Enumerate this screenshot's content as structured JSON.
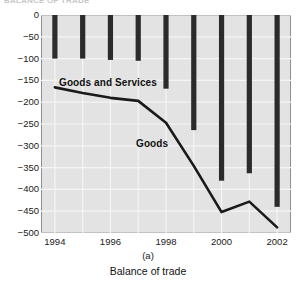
{
  "figure": {
    "clipped_heading": "BALANCE OF TRADE",
    "panel_letter": "(a)",
    "caption": "Balance of trade"
  },
  "colors": {
    "plot_background": "#e3e3e3",
    "gridline": "#f5f5f5",
    "bar": "#2b2b2b",
    "line": "#1a1a1a",
    "axis_border": "#8e8e8e",
    "text": "#111111"
  },
  "chart_data": {
    "type": "bar",
    "title": "Balance of trade",
    "xlabel": "",
    "ylabel": "",
    "xlim": [
      1993.5,
      2002.5
    ],
    "ylim": [
      -500,
      0
    ],
    "yticks": [
      0,
      -50,
      -100,
      -150,
      -200,
      -250,
      -300,
      -350,
      -400,
      -450,
      -500
    ],
    "ytick_labels": [
      "0",
      "-50",
      "-100",
      "-150",
      "-200",
      "-250",
      "-300",
      "-350",
      "-400",
      "-450",
      "-500"
    ],
    "xticks": [
      1994,
      1995,
      1996,
      1997,
      1998,
      1999,
      2000,
      2001,
      2002
    ],
    "xtick_labels": [
      "1994",
      "",
      "1996",
      "",
      "1998",
      "",
      "2000",
      "",
      "2002"
    ],
    "xtick_labels_shown": [
      "1994",
      "1996",
      "1998",
      "2000",
      "2002"
    ],
    "grid": true,
    "legend": "in-plot annotations",
    "categories": [
      1994,
      1995,
      1996,
      1997,
      1998,
      1999,
      2000,
      2001,
      2002
    ],
    "values": [
      -100,
      -100,
      -103,
      -105,
      -169,
      -264,
      -380,
      -363,
      -440
    ],
    "series": [
      {
        "name": "Goods and Services",
        "type": "bar",
        "x": [
          1994,
          1995,
          1996,
          1997,
          1998,
          1999,
          2000,
          2001,
          2002
        ],
        "values": [
          -100,
          -100,
          -103,
          -105,
          -169,
          -264,
          -380,
          -363,
          -440
        ]
      },
      {
        "name": "Goods",
        "type": "line",
        "x": [
          1994,
          1995,
          1996,
          1997,
          1998,
          1999,
          2000,
          2001,
          2002
        ],
        "values": [
          -166,
          -179,
          -190,
          -197,
          -247,
          -346,
          -452,
          -428,
          -487
        ]
      }
    ],
    "annotations": [
      {
        "text": "Goods and Services",
        "x": 1994.6,
        "y": -110
      },
      {
        "text": "Goods",
        "x": 1997.6,
        "y": -285
      }
    ]
  }
}
